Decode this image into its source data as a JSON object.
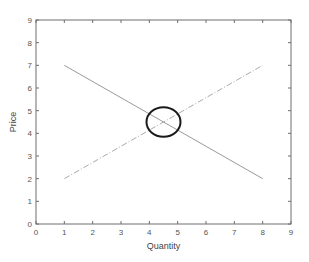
{
  "chart_data": {
    "type": "line",
    "title": "",
    "xlabel": "Quantity",
    "ylabel": "Price",
    "xlim": [
      0,
      9
    ],
    "ylim": [
      0,
      9
    ],
    "xticks": [
      "0",
      "1",
      "2",
      "3",
      "4",
      "5",
      "6",
      "7",
      "8",
      "9"
    ],
    "yticks": [
      "0",
      "1",
      "2",
      "3",
      "4",
      "5",
      "6",
      "7",
      "8",
      "9"
    ],
    "grid": false,
    "legend": null,
    "series": [
      {
        "name": "Demand",
        "style": "solid",
        "color": "#9a9a9a",
        "x": [
          1,
          8
        ],
        "y": [
          7,
          2
        ]
      },
      {
        "name": "Supply",
        "style": "dash-dot",
        "color": "#aaaaaa",
        "x": [
          1,
          8
        ],
        "y": [
          2,
          7
        ]
      }
    ],
    "annotations": [
      {
        "type": "ellipse",
        "cx": 4.5,
        "cy": 4.5,
        "rx": 0.6,
        "ry": 0.65,
        "color": "#1a1a1a",
        "label": "equilibrium"
      }
    ]
  }
}
